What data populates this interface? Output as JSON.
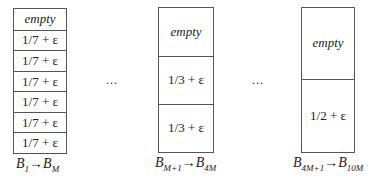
{
  "bins": [
    {
      "id": "bin-group-1",
      "cells": [
        "empty",
        "1/7 + ε",
        "1/7 + ε",
        "1/7 + ε",
        "1/7 + ε",
        "1/7 + ε",
        "1/7 + ε"
      ],
      "label": {
        "from_var": "B",
        "from_sub": "1",
        "arrow": "→",
        "to_var": "B",
        "to_sub": "M"
      }
    },
    {
      "id": "bin-group-2",
      "cells": [
        "empty",
        "1/3 + ε",
        "1/3 + ε"
      ],
      "label": {
        "from_var": "B",
        "from_sub": "M+1",
        "arrow": "→",
        "to_var": "B",
        "to_sub": "4M"
      }
    },
    {
      "id": "bin-group-3",
      "cells": [
        "empty",
        "1/2 + ε"
      ],
      "label": {
        "from_var": "B",
        "from_sub": "4M+1",
        "arrow": "→",
        "to_var": "B",
        "to_sub": "10M"
      }
    }
  ],
  "ellipsis": "..."
}
